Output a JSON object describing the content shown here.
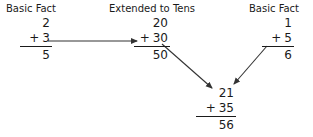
{
  "diagram": {
    "title_left": "Basic Fact",
    "title_middle": "Extended to Tens",
    "title_right": "Basic Fact",
    "line_color": "#333333",
    "text_color": "#1a1a1a",
    "background": "#ffffff"
  },
  "problems": {
    "left": {
      "label": "Basic Fact",
      "top_addend": "2",
      "operator": "+",
      "bottom_addend": "3",
      "sum": "5"
    },
    "middle": {
      "label": "Extended to Tens",
      "top_addend": "20",
      "operator": "+",
      "bottom_addend": "30",
      "sum": "50"
    },
    "right": {
      "label": "Basic Fact",
      "top_addend": "1",
      "operator": "+",
      "bottom_addend": "5",
      "sum": "6"
    },
    "result": {
      "top_addend": "21",
      "operator": "+",
      "bottom_addend": "35",
      "sum": "56"
    }
  },
  "arrows": [
    {
      "name": "basic-fact-to-extended-tens",
      "from": "left",
      "to": "middle"
    },
    {
      "name": "extended-tens-to-result",
      "from": "middle",
      "to": "result"
    },
    {
      "name": "basic-fact-right-to-result",
      "from": "right",
      "to": "result"
    }
  ]
}
